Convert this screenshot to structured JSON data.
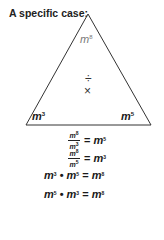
{
  "title": "A specific case:",
  "triangle": {
    "top": {
      "base": "m",
      "exp": "8"
    },
    "left": {
      "base": "m",
      "exp": "3"
    },
    "right": {
      "base": "m",
      "exp": "5"
    },
    "operators": {
      "divide": "÷",
      "multiply": "×"
    },
    "stroke_color": "#333333"
  },
  "equations": [
    {
      "num_base": "m",
      "num_exp": "8",
      "den_base": "m",
      "den_exp": "3",
      "eq": "=",
      "rhs_base": "m",
      "rhs_exp": "5"
    },
    {
      "num_base": "m",
      "num_exp": "8",
      "den_base": "m",
      "den_exp": "5",
      "eq": "=",
      "rhs_base": "m",
      "rhs_exp": "3"
    },
    {
      "a_base": "m",
      "a_exp": "3",
      "dot": "•",
      "b_base": "m",
      "b_exp": "5",
      "eq": "=",
      "rhs_base": "m",
      "rhs_exp": "8"
    },
    {
      "a_base": "m",
      "a_exp": "5",
      "dot": "•",
      "b_base": "m",
      "b_exp": "3",
      "eq": "=",
      "rhs_base": "m",
      "rhs_exp": "8"
    }
  ]
}
